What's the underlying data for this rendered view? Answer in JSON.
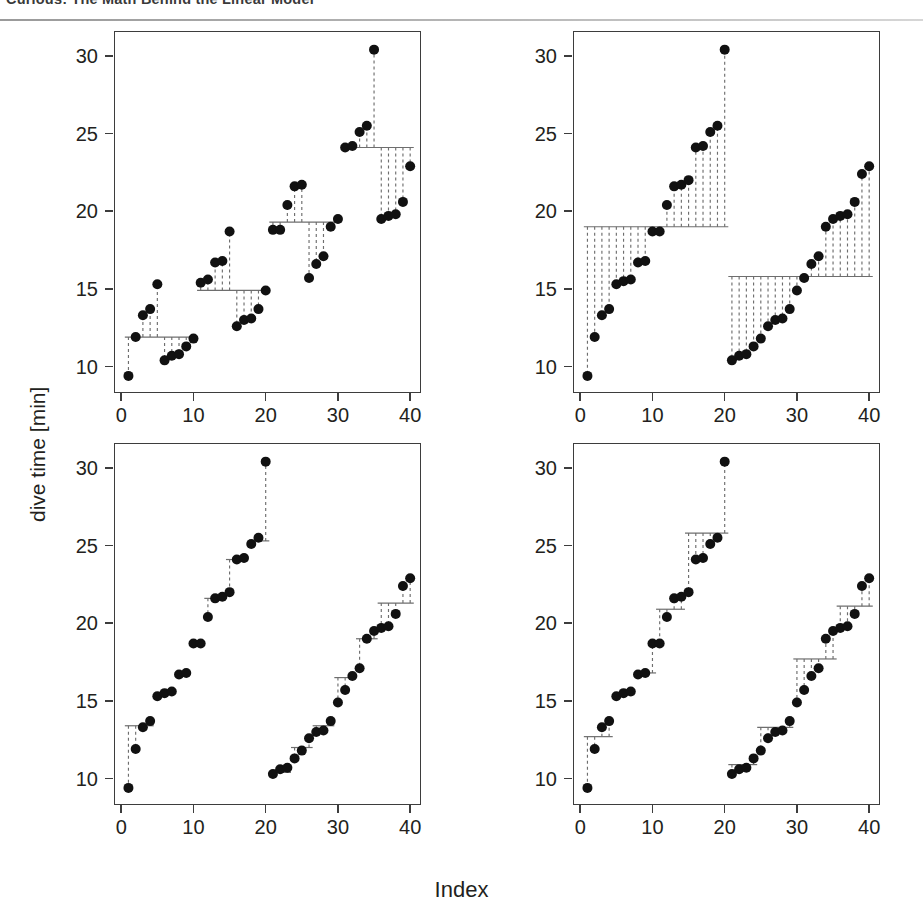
{
  "header": {
    "title": "Curious: The Math Behind the Linear Model"
  },
  "figure": {
    "xlabel": "Index",
    "ylabel": "dive time [min]",
    "xticks": [
      0,
      10,
      20,
      30,
      40
    ],
    "yticks": [
      10,
      15,
      20,
      25,
      30
    ],
    "xlim": [
      -1.0,
      41.5
    ],
    "ylim": [
      8.3,
      31.6
    ],
    "point_color": "#111111",
    "step_color": "#6e6e6e",
    "frame_color": "#3d3d3d"
  },
  "chart_data": [
    {
      "id": "panel-top-left",
      "type": "scatter",
      "title": "",
      "xlabel": "Index",
      "ylabel": "dive time [min]",
      "xlim": [
        -1.0,
        41.5
      ],
      "ylim": [
        8.3,
        31.6
      ],
      "xticks": [
        0,
        10,
        20,
        30,
        40
      ],
      "yticks": [
        10,
        15,
        20,
        25,
        30
      ],
      "grid": false,
      "legend": null,
      "n_groups": 4,
      "group_label": "four interleaved groups of 10",
      "x": [
        1,
        2,
        3,
        4,
        5,
        6,
        7,
        8,
        9,
        10,
        11,
        12,
        13,
        14,
        15,
        16,
        17,
        18,
        19,
        20,
        21,
        22,
        23,
        24,
        25,
        26,
        27,
        28,
        29,
        30,
        31,
        32,
        33,
        34,
        35,
        36,
        37,
        38,
        39,
        40
      ],
      "y": [
        9.4,
        11.9,
        13.3,
        13.7,
        15.3,
        10.4,
        10.7,
        10.8,
        11.3,
        11.8,
        15.4,
        15.6,
        16.7,
        16.8,
        18.7,
        12.6,
        13.0,
        13.1,
        13.7,
        14.9,
        18.8,
        18.8,
        20.4,
        21.6,
        21.7,
        15.7,
        16.6,
        17.1,
        19.0,
        19.5,
        24.1,
        24.2,
        25.1,
        25.5,
        30.4,
        19.5,
        19.7,
        19.8,
        20.6,
        22.9
      ],
      "steps": [
        {
          "x_from": 0.5,
          "x_to": 10.5,
          "level": 11.9
        },
        {
          "x_from": 10.5,
          "x_to": 20.5,
          "level": 14.9
        },
        {
          "x_from": 20.5,
          "x_to": 30.5,
          "level": 19.3
        },
        {
          "x_from": 30.5,
          "x_to": 40.5,
          "level": 24.1
        }
      ]
    },
    {
      "id": "panel-top-right",
      "type": "scatter",
      "title": "",
      "xlabel": "Index",
      "ylabel": "dive time [min]",
      "xlim": [
        -1.0,
        41.5
      ],
      "ylim": [
        8.3,
        31.6
      ],
      "xticks": [
        0,
        10,
        20,
        30,
        40
      ],
      "yticks": [
        10,
        15,
        20,
        25,
        30
      ],
      "grid": false,
      "legend": null,
      "n_groups": 2,
      "group_label": "two groups of 20",
      "x": [
        1,
        2,
        3,
        4,
        5,
        6,
        7,
        8,
        9,
        10,
        11,
        12,
        13,
        14,
        15,
        16,
        17,
        18,
        19,
        20,
        21,
        22,
        23,
        24,
        25,
        26,
        27,
        28,
        29,
        30,
        31,
        32,
        33,
        34,
        35,
        36,
        37,
        38,
        39,
        40
      ],
      "y": [
        9.4,
        11.9,
        13.3,
        13.7,
        15.3,
        15.5,
        15.6,
        16.7,
        16.8,
        18.7,
        18.7,
        20.4,
        21.6,
        21.7,
        22.0,
        24.1,
        24.2,
        25.1,
        25.5,
        30.4,
        10.4,
        10.7,
        10.8,
        11.3,
        11.8,
        12.6,
        13.0,
        13.1,
        13.7,
        14.9,
        15.7,
        16.6,
        17.1,
        19.0,
        19.5,
        19.7,
        19.8,
        20.6,
        22.4,
        22.9
      ],
      "steps": [
        {
          "x_from": 0.5,
          "x_to": 20.5,
          "level": 19.0
        },
        {
          "x_from": 20.5,
          "x_to": 40.5,
          "level": 15.8
        }
      ]
    },
    {
      "id": "panel-bottom-left",
      "type": "scatter",
      "title": "",
      "xlabel": "Index",
      "ylabel": "dive time [min]",
      "xlim": [
        -1.0,
        41.5
      ],
      "ylim": [
        8.3,
        31.6
      ],
      "xticks": [
        0,
        10,
        20,
        30,
        40
      ],
      "yticks": [
        10,
        15,
        20,
        25,
        30
      ],
      "grid": false,
      "legend": null,
      "n_groups": 14,
      "group_label": "many small groups",
      "x": [
        1,
        2,
        3,
        4,
        5,
        6,
        7,
        8,
        9,
        10,
        11,
        12,
        13,
        14,
        15,
        16,
        17,
        18,
        19,
        20,
        21,
        22,
        23,
        24,
        25,
        26,
        27,
        28,
        29,
        30,
        31,
        32,
        33,
        34,
        35,
        36,
        37,
        38,
        39,
        40
      ],
      "y": [
        9.4,
        11.9,
        13.3,
        13.7,
        15.3,
        15.5,
        15.6,
        16.7,
        16.8,
        18.7,
        18.7,
        20.4,
        21.6,
        21.7,
        22.0,
        24.1,
        24.2,
        25.1,
        25.5,
        30.4,
        10.3,
        10.6,
        10.7,
        11.3,
        11.8,
        12.6,
        13.0,
        13.1,
        13.7,
        14.9,
        15.7,
        16.6,
        17.1,
        19.0,
        19.5,
        19.7,
        19.8,
        20.6,
        22.4,
        22.9
      ],
      "steps": [
        {
          "x_from": 0.5,
          "x_to": 2.5,
          "level": 13.4
        },
        {
          "x_from": 2.5,
          "x_to": 4.5,
          "level": 13.4
        },
        {
          "x_from": 4.5,
          "x_to": 7.5,
          "level": 15.5
        },
        {
          "x_from": 7.5,
          "x_to": 9.5,
          "level": 16.8
        },
        {
          "x_from": 9.5,
          "x_to": 11.5,
          "level": 18.7
        },
        {
          "x_from": 11.5,
          "x_to": 14.5,
          "level": 21.6
        },
        {
          "x_from": 14.5,
          "x_to": 17.5,
          "level": 24.1
        },
        {
          "x_from": 17.5,
          "x_to": 20.5,
          "level": 25.3
        },
        {
          "x_from": 20.5,
          "x_to": 23.5,
          "level": 10.4
        },
        {
          "x_from": 23.5,
          "x_to": 26.5,
          "level": 12.0
        },
        {
          "x_from": 26.5,
          "x_to": 29.5,
          "level": 13.4
        },
        {
          "x_from": 29.5,
          "x_to": 32.5,
          "level": 16.5
        },
        {
          "x_from": 32.5,
          "x_to": 35.5,
          "level": 19.0
        },
        {
          "x_from": 35.5,
          "x_to": 40.5,
          "level": 21.3
        }
      ]
    },
    {
      "id": "panel-bottom-right",
      "type": "scatter",
      "title": "",
      "xlabel": "Index",
      "ylabel": "dive time [min]",
      "xlim": [
        -1.0,
        41.5
      ],
      "ylim": [
        8.3,
        31.6
      ],
      "xticks": [
        0,
        10,
        20,
        30,
        40
      ],
      "yticks": [
        10,
        15,
        20,
        25,
        30
      ],
      "grid": false,
      "legend": null,
      "n_groups": 14,
      "group_label": "many small groups",
      "x": [
        1,
        2,
        3,
        4,
        5,
        6,
        7,
        8,
        9,
        10,
        11,
        12,
        13,
        14,
        15,
        16,
        17,
        18,
        19,
        20,
        21,
        22,
        23,
        24,
        25,
        26,
        27,
        28,
        29,
        30,
        31,
        32,
        33,
        34,
        35,
        36,
        37,
        38,
        39,
        40
      ],
      "y": [
        9.4,
        11.9,
        13.3,
        13.7,
        15.3,
        15.5,
        15.6,
        16.7,
        16.8,
        18.7,
        18.7,
        20.4,
        21.6,
        21.7,
        22.0,
        24.1,
        24.2,
        25.1,
        25.5,
        30.4,
        10.3,
        10.6,
        10.7,
        11.3,
        11.8,
        12.6,
        13.0,
        13.1,
        13.7,
        14.9,
        15.7,
        16.6,
        17.1,
        19.0,
        19.5,
        19.7,
        19.8,
        20.6,
        22.4,
        22.9
      ],
      "steps": [
        {
          "x_from": 0.5,
          "x_to": 4.5,
          "level": 12.7
        },
        {
          "x_from": 4.5,
          "x_to": 7.5,
          "level": 15.4
        },
        {
          "x_from": 7.5,
          "x_to": 10.5,
          "level": 16.8
        },
        {
          "x_from": 10.5,
          "x_to": 14.5,
          "level": 20.9
        },
        {
          "x_from": 14.5,
          "x_to": 19.5,
          "level": 25.8
        },
        {
          "x_from": 19.5,
          "x_to": 20.5,
          "level": 25.8
        },
        {
          "x_from": 20.5,
          "x_to": 24.5,
          "level": 10.9
        },
        {
          "x_from": 24.5,
          "x_to": 29.5,
          "level": 13.3
        },
        {
          "x_from": 29.5,
          "x_to": 32.5,
          "level": 17.7
        },
        {
          "x_from": 32.5,
          "x_to": 35.5,
          "level": 17.7
        },
        {
          "x_from": 35.5,
          "x_to": 40.5,
          "level": 21.1
        }
      ]
    }
  ],
  "panel_geometry": [
    {
      "id": "panel-top-left",
      "left": 114,
      "top": 9,
      "width": 307,
      "height": 362
    },
    {
      "id": "panel-top-right",
      "left": 573,
      "top": 9,
      "width": 307,
      "height": 362
    },
    {
      "id": "panel-bottom-left",
      "left": 114,
      "top": 421,
      "width": 307,
      "height": 362
    },
    {
      "id": "panel-bottom-right",
      "left": 573,
      "top": 421,
      "width": 307,
      "height": 362
    }
  ]
}
